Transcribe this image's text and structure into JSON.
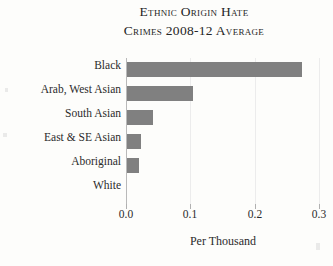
{
  "chart_data": {
    "type": "bar",
    "orientation": "horizontal",
    "title": "Ethnic Origin Hate Crimes 2008-12 Average",
    "title_lines": [
      "Ethnic Origin Hate",
      "Crimes 2008-12 Average"
    ],
    "categories": [
      "Black",
      "Arab, West Asian",
      "South Asian",
      "East & SE Asian",
      "Aboriginal",
      "White"
    ],
    "values": [
      0.27,
      0.102,
      0.04,
      0.022,
      0.018,
      0.0
    ],
    "xlabel": "Per Thousand",
    "ylabel": "",
    "xlim": [
      0.0,
      0.3
    ],
    "xticks": [
      0.0,
      0.1,
      0.2,
      0.3
    ],
    "xtick_labels": [
      "0.0",
      "0.1",
      "0.2",
      "0.3"
    ],
    "grid": true,
    "legend": false,
    "bar_color": "#808080",
    "background_color": "#fdfdfb",
    "text_color": "#2b2b2b",
    "gridline_color": "#ececec"
  }
}
